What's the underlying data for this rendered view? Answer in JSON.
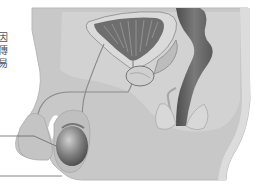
{
  "figure": {
    "caption_fragment": [
      "因",
      "傳",
      "易"
    ],
    "colors": {
      "background": "#ffffff",
      "body_tissue": "#c8c8c8",
      "inner_tissue": "#d6d6d6",
      "organ_dark": "#6a6a6a",
      "outline": "#888888",
      "leader_line": "#666666"
    },
    "labels": {
      "leader_lines": 2
    }
  }
}
